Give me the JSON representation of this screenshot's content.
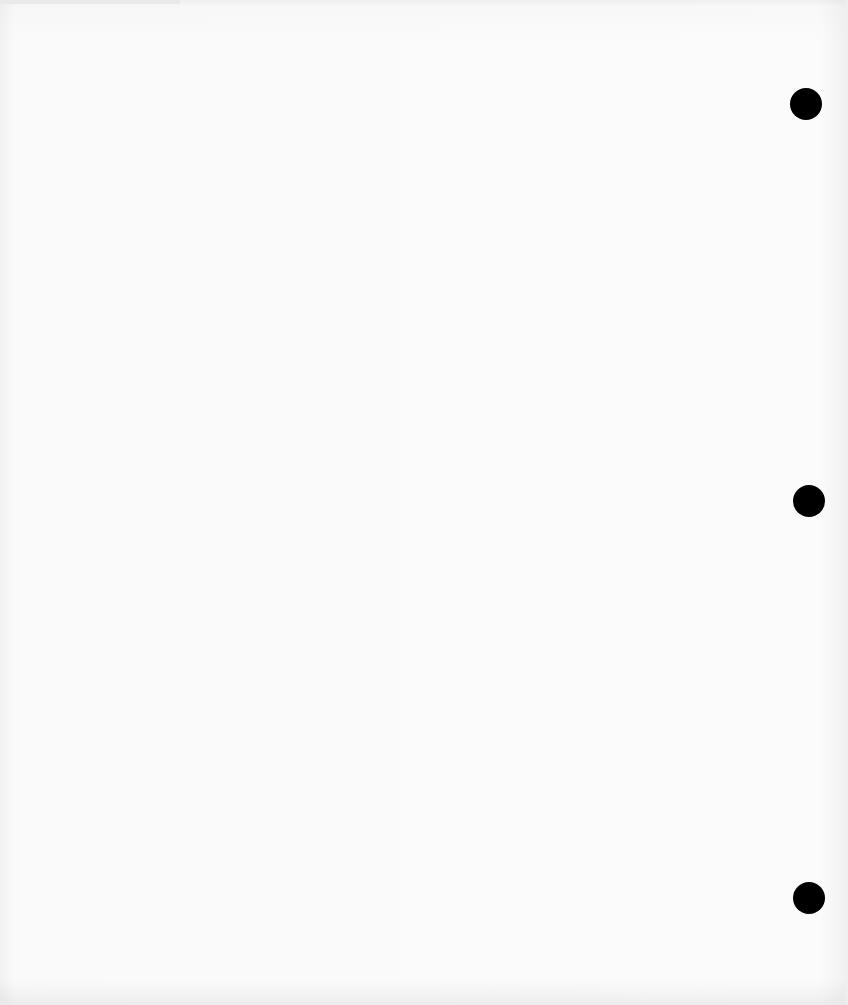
{
  "scene": {
    "description": "Blank sheet of white three-hole-punched paper",
    "paper_color": "#fdfdfd",
    "hole_color": "#000000",
    "holes": [
      {
        "id": "top",
        "cx": 806,
        "cy": 104,
        "diameter": 32
      },
      {
        "id": "middle",
        "cx": 809,
        "cy": 501,
        "diameter": 32
      },
      {
        "id": "bottom",
        "cx": 809,
        "cy": 898,
        "diameter": 32
      }
    ]
  }
}
